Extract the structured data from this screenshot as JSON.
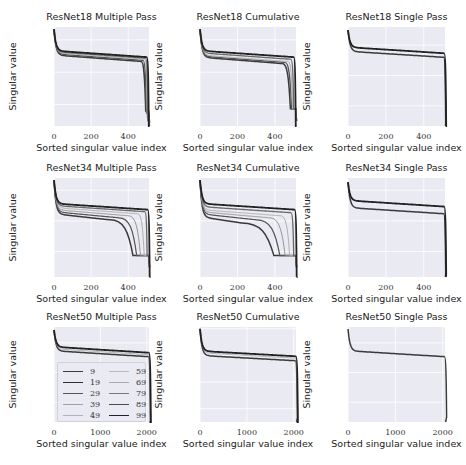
{
  "figure": {
    "xlabel": "Sorted singular value index",
    "ylabel": "Singular value",
    "colors": {
      "plot_bg": "#eaeaf2",
      "grid": "#ffffff",
      "text": "#222222"
    },
    "legend": {
      "labels": [
        "9",
        "19",
        "29",
        "39",
        "49",
        "59",
        "69",
        "79",
        "89",
        "99"
      ],
      "colors": [
        "#3a3a3a",
        "#2e2e2e",
        "#555555",
        "#a0a0a0",
        "#b4b4b4",
        "#b8b8b8",
        "#aaaaaa",
        "#7a7a7a",
        "#4a4a4a",
        "#222222"
      ],
      "widths": [
        1.6,
        1.4,
        1.6,
        0.8,
        0.8,
        0.8,
        0.8,
        1.2,
        1.4,
        1.8
      ]
    }
  },
  "chart_data": [
    {
      "type": "line",
      "title": "ResNet18 Multiple Pass",
      "xlabel": "Sorted singular value index",
      "ylabel": "Singular value",
      "yscale": "log",
      "xlim": [
        0,
        512
      ],
      "ylim_log10": [
        -6,
        3.2
      ],
      "xticks": [
        0,
        200,
        400
      ],
      "yticks": [
        {
          "base": "10",
          "exp": "2",
          "log": 2
        },
        {
          "base": "10",
          "exp": "−1",
          "log": -1
        },
        {
          "base": "10",
          "exp": "−4",
          "log": -4
        }
      ],
      "series_desc": "10 curves (epochs 9..99) starting ~10^3, plateau ~10^0, dropping steeply near index 470-510 to ~10^-4..10^-6",
      "curves": [
        {
          "start": 3.0,
          "plateau": 0.6,
          "knee": 470,
          "floor": -4.6,
          "end": 512
        },
        {
          "start": 3.0,
          "plateau": 0.7,
          "knee": 480,
          "floor": -4.8,
          "end": 512
        },
        {
          "start": 3.0,
          "plateau": 0.8,
          "knee": 490,
          "floor": -5.2,
          "end": 512
        },
        {
          "start": 3.0,
          "plateau": 0.9,
          "knee": 495,
          "floor": -5.5,
          "end": 512
        },
        {
          "start": 3.0,
          "plateau": 1.0,
          "knee": 500,
          "floor": -6.0,
          "end": 512
        }
      ]
    },
    {
      "type": "line",
      "title": "ResNet18 Cumulative",
      "xlabel": "Sorted singular value index",
      "ylabel": "Singular value",
      "yscale": "log",
      "xlim": [
        0,
        512
      ],
      "ylim_log10": [
        -6,
        3.2
      ],
      "xticks": [
        0,
        200,
        400
      ],
      "yticks": [
        {
          "base": "10",
          "exp": "2",
          "log": 2
        },
        {
          "base": "10",
          "exp": "−1",
          "log": -1
        },
        {
          "base": "10",
          "exp": "−4",
          "log": -4
        }
      ],
      "series_desc": "Curves plateau ~10^0, drop between index 440-510 and bottom out at a flat floor ~10^-4.4",
      "curves": [
        {
          "start": 3.0,
          "plateau": 0.4,
          "knee": 440,
          "floor": -4.4,
          "end": 512
        },
        {
          "start": 3.0,
          "plateau": 0.5,
          "knee": 455,
          "floor": -4.4,
          "end": 512
        },
        {
          "start": 3.0,
          "plateau": 0.6,
          "knee": 470,
          "floor": -4.4,
          "end": 512
        },
        {
          "start": 3.0,
          "plateau": 0.8,
          "knee": 485,
          "floor": -4.4,
          "end": 512
        },
        {
          "start": 3.0,
          "plateau": 1.0,
          "knee": 500,
          "floor": -6.0,
          "end": 512
        }
      ]
    },
    {
      "type": "line",
      "title": "ResNet18 Single Pass",
      "xlabel": "Sorted singular value index",
      "ylabel": "Singular value",
      "yscale": "log",
      "xlim": [
        0,
        512
      ],
      "ylim_log10": [
        -7,
        2.8
      ],
      "xticks": [
        0,
        200,
        400
      ],
      "yticks": [
        {
          "base": "10",
          "exp": "1",
          "log": 1
        },
        {
          "base": "10",
          "exp": "−2",
          "log": -2
        },
        {
          "base": "10",
          "exp": "−5",
          "log": -5
        }
      ],
      "series_desc": "Two tight bundles plateau ~10^0.5-10^1, sharp drop at ~505 to ~10^-7",
      "curves": [
        {
          "start": 2.5,
          "plateau": 0.4,
          "knee": 505,
          "floor": -6.5,
          "end": 512
        },
        {
          "start": 2.5,
          "plateau": 0.8,
          "knee": 508,
          "floor": -7.0,
          "end": 512
        }
      ]
    },
    {
      "type": "line",
      "title": "ResNet34 Multiple Pass",
      "xlabel": "Sorted singular value index",
      "ylabel": "Singular value",
      "yscale": "log",
      "xlim": [
        0,
        512
      ],
      "ylim_log10": [
        -6.5,
        3.2
      ],
      "xticks": [
        0,
        200,
        400
      ],
      "yticks": [
        {
          "base": "10",
          "exp": "2",
          "log": 2
        },
        {
          "base": "10",
          "exp": "−1",
          "log": -1
        },
        {
          "base": "10",
          "exp": "−4",
          "log": -4
        }
      ],
      "series_desc": "Fan of curves: early epochs drop gradually from ~index 250 reaching floor 10^-4.4 at ~380; later epochs stay ~10^0.5 until ~500",
      "curves": [
        {
          "start": 3.0,
          "plateau": -0.3,
          "knee": 300,
          "floor": -4.4,
          "end": 512
        },
        {
          "start": 3.0,
          "plateau": -0.1,
          "knee": 350,
          "floor": -4.4,
          "end": 512
        },
        {
          "start": 3.0,
          "plateau": 0.1,
          "knee": 400,
          "floor": -4.4,
          "end": 512
        },
        {
          "start": 3.0,
          "plateau": 0.3,
          "knee": 450,
          "floor": -4.4,
          "end": 512
        },
        {
          "start": 3.0,
          "plateau": 0.5,
          "knee": 490,
          "floor": -4.4,
          "end": 512
        },
        {
          "start": 3.0,
          "plateau": 0.7,
          "knee": 505,
          "floor": -6.5,
          "end": 512
        }
      ]
    },
    {
      "type": "line",
      "title": "ResNet34 Cumulative",
      "xlabel": "Sorted singular value index",
      "ylabel": "Singular value",
      "yscale": "log",
      "xlim": [
        0,
        512
      ],
      "ylim_log10": [
        -6.5,
        3.2
      ],
      "xticks": [
        0,
        200,
        400
      ],
      "yticks": [
        {
          "base": "10",
          "exp": "2",
          "log": 2
        },
        {
          "base": "10",
          "exp": "−1",
          "log": -1
        },
        {
          "base": "10",
          "exp": "−4",
          "log": -4
        }
      ],
      "series_desc": "Fan: earliest epoch hits floor 10^-4.4 at ~250; later epochs progressively later; final stays high until ~500",
      "curves": [
        {
          "start": 3.0,
          "plateau": -0.6,
          "knee": 220,
          "floor": -4.4,
          "end": 512
        },
        {
          "start": 3.0,
          "plateau": -0.3,
          "knee": 300,
          "floor": -4.4,
          "end": 512
        },
        {
          "start": 3.0,
          "plateau": -0.1,
          "knee": 370,
          "floor": -4.4,
          "end": 512
        },
        {
          "start": 3.0,
          "plateau": 0.1,
          "knee": 430,
          "floor": -4.4,
          "end": 512
        },
        {
          "start": 3.0,
          "plateau": 0.4,
          "knee": 485,
          "floor": -4.4,
          "end": 512
        },
        {
          "start": 3.0,
          "plateau": 0.7,
          "knee": 505,
          "floor": -6.5,
          "end": 512
        }
      ]
    },
    {
      "type": "line",
      "title": "ResNet34 Single Pass",
      "xlabel": "Sorted singular value index",
      "ylabel": "Singular value",
      "yscale": "log",
      "xlim": [
        0,
        512
      ],
      "ylim_log10": [
        -6.5,
        3.2
      ],
      "xticks": [
        0,
        200,
        400
      ],
      "yticks": [
        {
          "base": "10",
          "exp": "2",
          "log": 2
        },
        {
          "base": "10",
          "exp": "−1",
          "log": -1
        },
        {
          "base": "10",
          "exp": "−4",
          "log": -4
        }
      ],
      "series_desc": "Two bundles plateau ~10^0.5-10^1.2, sharp drop at ~505 to ~10^-6",
      "curves": [
        {
          "start": 2.8,
          "plateau": 0.3,
          "knee": 505,
          "floor": -6.0,
          "end": 512
        },
        {
          "start": 2.8,
          "plateau": 1.0,
          "knee": 508,
          "floor": -6.3,
          "end": 512
        }
      ]
    },
    {
      "type": "line",
      "title": "ResNet50 Multiple Pass",
      "xlabel": "Sorted singular value index",
      "ylabel": "Singular value",
      "yscale": "log",
      "xlim": [
        0,
        2048
      ],
      "ylim_log10": [
        -7,
        2.6
      ],
      "xticks": [
        0,
        1000,
        2000
      ],
      "yticks": [
        {
          "base": "10",
          "exp": "1",
          "log": 1
        },
        {
          "base": "10",
          "exp": "−2",
          "log": -2
        },
        {
          "base": "10",
          "exp": "−5",
          "log": -5
        }
      ],
      "legend": [
        "9",
        "19",
        "29",
        "39",
        "49",
        "59",
        "69",
        "79",
        "89",
        "99"
      ],
      "series_desc": "Curves plateau ~10^0-10^0.6, sharp drop at ~2040 to ~10^-7",
      "curves": [
        {
          "start": 2.3,
          "plateau": 0.2,
          "knee": 2035,
          "floor": -7.0,
          "end": 2048
        },
        {
          "start": 2.3,
          "plateau": 0.4,
          "knee": 2040,
          "floor": -7.0,
          "end": 2048
        },
        {
          "start": 2.3,
          "plateau": 0.6,
          "knee": 2045,
          "floor": -7.0,
          "end": 2048
        }
      ]
    },
    {
      "type": "line",
      "title": "ResNet50 Cumulative",
      "xlabel": "Sorted singular value index",
      "ylabel": "Singular value",
      "yscale": "log",
      "xlim": [
        0,
        2048
      ],
      "ylim_log10": [
        -7.5,
        3.2
      ],
      "xticks": [
        0,
        1000,
        2000
      ],
      "yticks": [
        {
          "base": "10",
          "exp": "3",
          "log": 3
        },
        {
          "base": "10",
          "exp": "0",
          "log": 0
        },
        {
          "base": "10",
          "exp": "−3",
          "log": -3
        },
        {
          "base": "10",
          "exp": "−6",
          "log": -6
        }
      ],
      "series_desc": "Tight bundle plateau ~10^0-10^0.6, sharp drop at ~2040 to ~10^-7.5",
      "curves": [
        {
          "start": 3.0,
          "plateau": 0.0,
          "knee": 2035,
          "floor": -7.0,
          "end": 2048
        },
        {
          "start": 3.0,
          "plateau": 0.3,
          "knee": 2040,
          "floor": -7.3,
          "end": 2048
        },
        {
          "start": 3.0,
          "plateau": 0.5,
          "knee": 2045,
          "floor": -7.5,
          "end": 2048
        }
      ]
    },
    {
      "type": "line",
      "title": "ResNet50 Single Pass",
      "xlabel": "Sorted singular value index",
      "ylabel": "Singular value",
      "yscale": "log",
      "xlim": [
        0,
        2048
      ],
      "ylim_log10": [
        -7,
        2.6
      ],
      "xticks": [
        0,
        1000,
        2000
      ],
      "yticks": [
        {
          "base": "10",
          "exp": "1",
          "log": 1
        },
        {
          "base": "10",
          "exp": "−2",
          "log": -2
        },
        {
          "base": "10",
          "exp": "−5",
          "log": -5
        }
      ],
      "series_desc": "Single curve plateau ~10^0.2, sharp drop at ~2040 to ~10^-6.5",
      "curves": [
        {
          "start": 2.4,
          "plateau": 0.2,
          "knee": 2040,
          "floor": -6.5,
          "end": 2048
        }
      ]
    }
  ]
}
